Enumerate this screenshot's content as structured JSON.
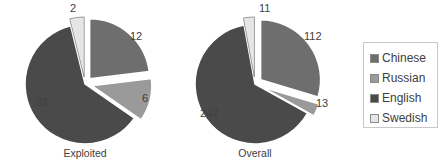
{
  "chart_data": [
    {
      "type": "pie",
      "title": "Exploited",
      "categories": [
        "Chinese",
        "Russian",
        "English",
        "Swedish"
      ],
      "values": [
        12,
        6,
        32,
        2
      ],
      "exploded": [
        true,
        true,
        false,
        true
      ],
      "colors": [
        "#6e6e6e",
        "#9a9a9a",
        "#4a4a4a",
        "#e6e6e6"
      ]
    },
    {
      "type": "pie",
      "title": "Overall",
      "categories": [
        "Chinese",
        "Russian",
        "English",
        "Swedish"
      ],
      "values": [
        112,
        13,
        242,
        11
      ],
      "exploded": [
        true,
        true,
        false,
        true
      ],
      "colors": [
        "#6e6e6e",
        "#9a9a9a",
        "#4a4a4a",
        "#e6e6e6"
      ]
    }
  ],
  "legend": {
    "items": [
      {
        "label": "Chinese",
        "color": "#6e6e6e"
      },
      {
        "label": "Russian",
        "color": "#9a9a9a"
      },
      {
        "label": "English",
        "color": "#4a4a4a"
      },
      {
        "label": "Swedish",
        "color": "#e6e6e6"
      }
    ]
  }
}
